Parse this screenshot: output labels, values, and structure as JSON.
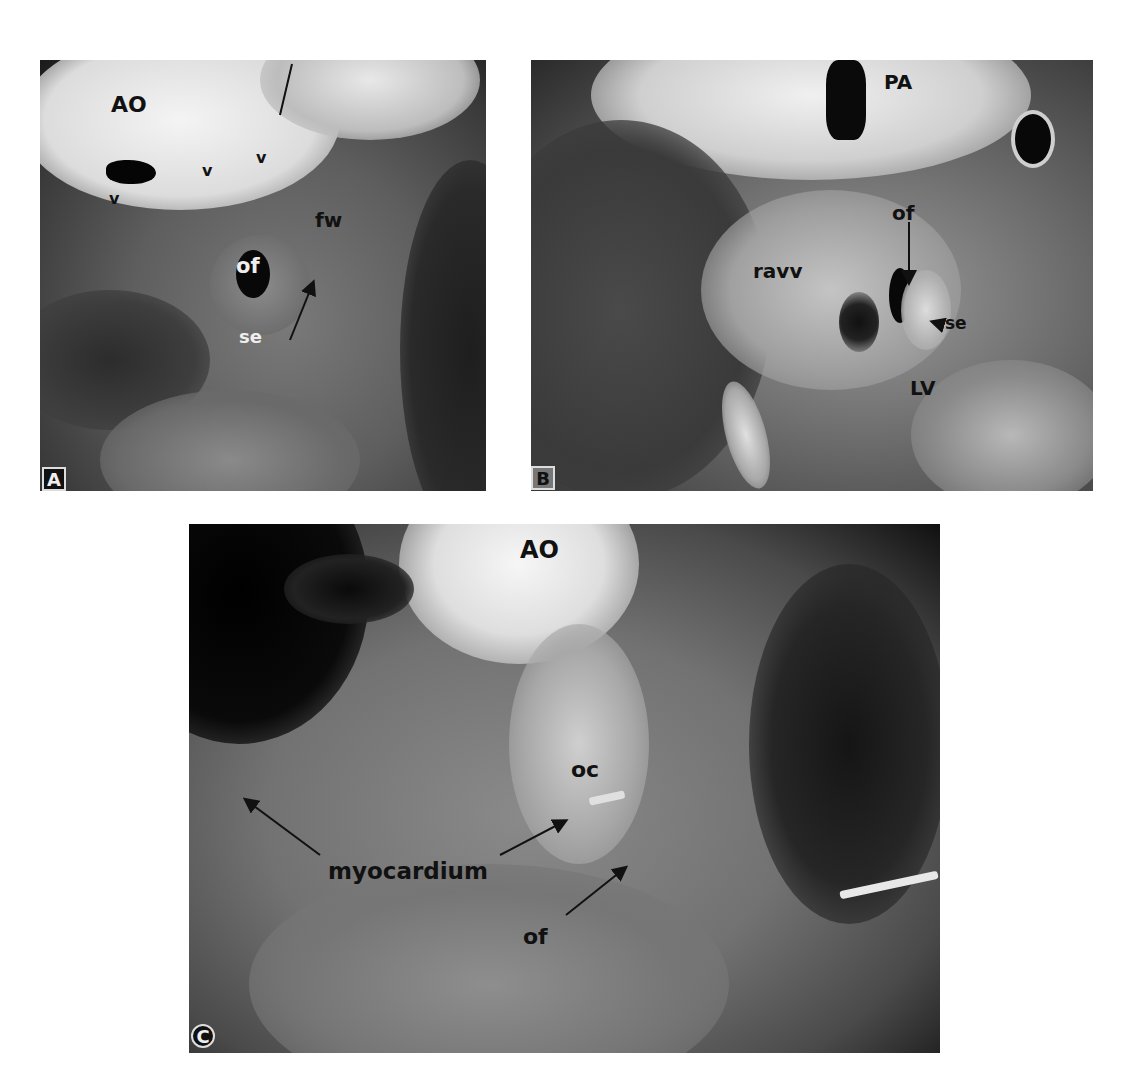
{
  "figure": {
    "panels": [
      {
        "id": "A",
        "letter": "A",
        "labels": {
          "ao": "AO",
          "v1": "v",
          "v2": "v",
          "v3": "v",
          "fw": "fw",
          "of": "of",
          "se": "se"
        }
      },
      {
        "id": "B",
        "letter": "B",
        "labels": {
          "pa": "PA",
          "of": "of",
          "ravv": "ravv",
          "se": "se",
          "lv": "LV"
        }
      },
      {
        "id": "C",
        "letter": "C",
        "labels": {
          "ao": "AO",
          "oc": "oc",
          "myocardium": "myocardium",
          "of": "of"
        }
      }
    ]
  }
}
